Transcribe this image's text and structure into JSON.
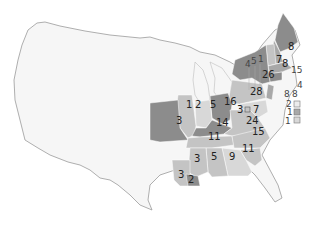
{
  "map": {
    "title": "US electoral map (eastern states shaded with electoral votes)",
    "colors": {
      "land": "#f6f6f6",
      "border": "#9a9a9a",
      "dark": "#8c8c8c",
      "medium": "#a8a8a8",
      "light": "#c4c4c4",
      "lighter": "#d8d8d8"
    },
    "states": [
      {
        "id": "ME",
        "votes": "8"
      },
      {
        "id": "NH",
        "votes": "7"
      },
      {
        "id": "VT",
        "votes": "8"
      },
      {
        "id": "MA",
        "votes": "15"
      },
      {
        "id": "NY",
        "votes": "26"
      },
      {
        "id": "RI",
        "votes": "4"
      },
      {
        "id": "CT",
        "votes": "8"
      },
      {
        "id": "NJ",
        "votes": "8"
      },
      {
        "id": "DE",
        "votes": "2"
      },
      {
        "id": "MD",
        "votes": "1"
      },
      {
        "id": "DC",
        "votes": "1"
      },
      {
        "id": "PA",
        "votes": "28"
      },
      {
        "id": "OH",
        "votes": "16"
      },
      {
        "id": "VA-split",
        "votes": "3"
      },
      {
        "id": "MD-west",
        "votes": "7"
      },
      {
        "id": "VA",
        "votes": "24"
      },
      {
        "id": "NC",
        "votes": "15"
      },
      {
        "id": "SC",
        "votes": "11"
      },
      {
        "id": "GA",
        "votes": "9"
      },
      {
        "id": "AL",
        "votes": "5"
      },
      {
        "id": "MS",
        "votes": "3"
      },
      {
        "id": "LA",
        "votes": "2"
      },
      {
        "id": "LA-west",
        "votes": "3"
      },
      {
        "id": "TN",
        "votes": "11"
      },
      {
        "id": "KY",
        "votes": "14"
      },
      {
        "id": "IN",
        "votes": "5"
      },
      {
        "id": "IL",
        "votes": "2"
      },
      {
        "id": "IL-split",
        "votes": "1"
      },
      {
        "id": "MO",
        "votes": "3"
      },
      {
        "id": "MI-1",
        "votes": "4"
      },
      {
        "id": "MI-2",
        "votes": "5"
      },
      {
        "id": "MI-3",
        "votes": "1"
      }
    ]
  }
}
